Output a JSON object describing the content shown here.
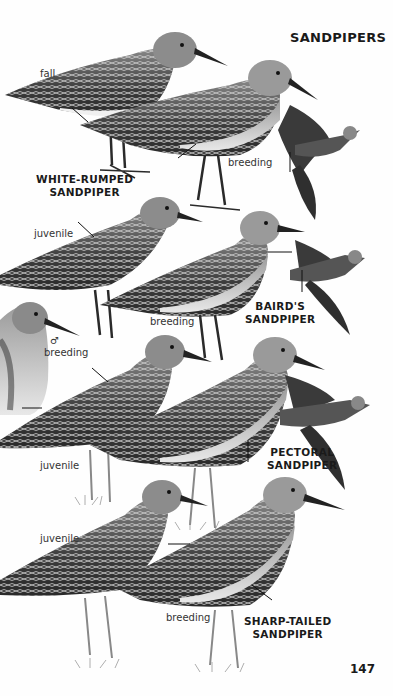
{
  "page": {
    "title": "SANDPIPERS",
    "page_number": "147"
  },
  "species": [
    {
      "name_line1": "WHITE-RUMPED",
      "name_line2": "SANDPIPER",
      "labels": [
        "fall",
        "breeding"
      ]
    },
    {
      "name_line1": "BAIRD'S",
      "name_line2": "SANDPIPER",
      "labels": [
        "juvenile",
        "breeding"
      ]
    },
    {
      "name_line1": "PECTORAL",
      "name_line2": "SANDPIPER",
      "labels": [
        "♂",
        "breeding",
        "juvenile"
      ]
    },
    {
      "name_line1": "SHARP-TAILED",
      "name_line2": "SANDPIPER",
      "labels": [
        "juvenile",
        "breeding"
      ]
    }
  ],
  "colors": {
    "ink": "#1a1a1a",
    "plumage_dark": "#3a3a3a",
    "plumage_mid": "#7a7a7a",
    "belly": "#f2f2f2"
  }
}
